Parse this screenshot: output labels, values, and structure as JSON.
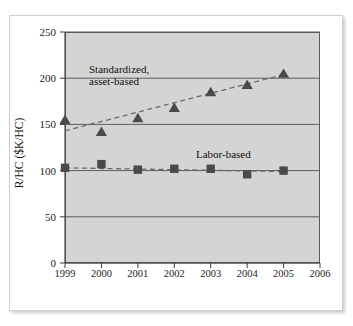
{
  "top_crop": {
    "text": ""
  },
  "chart_data": {
    "type": "scatter",
    "title": "",
    "xlabel": "",
    "ylabel": "R/HC ($K/HC)",
    "xlim": [
      1999,
      2006
    ],
    "ylim": [
      0,
      250
    ],
    "ytick_values": [
      0,
      50,
      100,
      150,
      200,
      250
    ],
    "ytick_labels": [
      "0",
      "50",
      "100",
      "150",
      "200",
      "250"
    ],
    "xtick_values": [
      1999,
      2000,
      2001,
      2002,
      2003,
      2004,
      2005,
      2006
    ],
    "xtick_labels": [
      "1999",
      "2000",
      "2001",
      "2002",
      "2003",
      "2004",
      "2005",
      "2006"
    ],
    "grid": "horizontal",
    "legend_position": "inline-annotations",
    "plot_background": "#d4d4d4",
    "marker_color": "#4a4a4a",
    "trendline_color": "#6a6a6a",
    "x": [
      1999,
      2000,
      2001,
      2002,
      2003,
      2004,
      2005
    ],
    "series": [
      {
        "name": "Standardized, asset-based",
        "marker": "triangle",
        "values": [
          155,
          142,
          157,
          168,
          185,
          193,
          205
        ],
        "trendline": {
          "x": [
            1999,
            2005
          ],
          "y": [
            143,
            204
          ],
          "style": "dashed"
        }
      },
      {
        "name": "Labor-based",
        "marker": "square",
        "values": [
          103,
          107,
          101,
          102,
          102,
          96,
          100
        ],
        "trendline": {
          "x": [
            1999,
            2005
          ],
          "y": [
            103,
            99
          ],
          "style": "dashed"
        }
      }
    ],
    "annotations": [
      {
        "name": "standardized-asset-based",
        "line1": "Standardized,",
        "line2": "asset-based"
      },
      {
        "name": "labor-based",
        "line1": "Labor-based",
        "line2": ""
      }
    ]
  }
}
